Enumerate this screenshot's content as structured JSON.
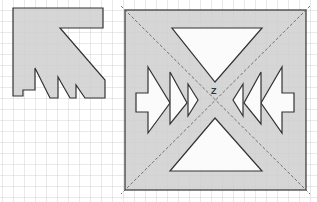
{
  "diagram": {
    "grid": {
      "spacing": 11,
      "color": "#c8c8c8"
    },
    "colors": {
      "fill": "#cfcfcf",
      "stroke": "#333333",
      "hole": "#ffffff",
      "diagonal": "#555555"
    },
    "center_label": "Z",
    "left_figure": {
      "points": "13,8 103,8 103,28 60,28 105,80 105,98 85,98 76,85 76,98 70,98 58,77 58,98 50,98 35,68 35,90 23,90 23,96 13,96"
    },
    "right_figure": {
      "square": {
        "x": 125,
        "y": 10,
        "w": 181,
        "h": 180
      },
      "holes": [
        {
          "name": "top-triangle",
          "points": "172,28 262,28 215,82"
        },
        {
          "name": "bottom-triangle",
          "points": "215,118 262,171 170,171"
        },
        {
          "name": "left-arrow",
          "points": "148,67 170,103 148,133 148,112 136,112 136,93 148,93"
        },
        {
          "name": "left-triangle-2",
          "points": "170,72 187,103 170,124"
        },
        {
          "name": "left-triangle-3",
          "points": "188,84 198,100 188,116"
        },
        {
          "name": "right-arrow",
          "points": "282,67 282,93 294,93 294,112 282,112 282,133 261,103"
        },
        {
          "name": "right-triangle-2",
          "points": "261,72 261,124 244,103"
        },
        {
          "name": "right-triangle-3",
          "points": "243,84 243,116 233,100"
        }
      ]
    }
  }
}
